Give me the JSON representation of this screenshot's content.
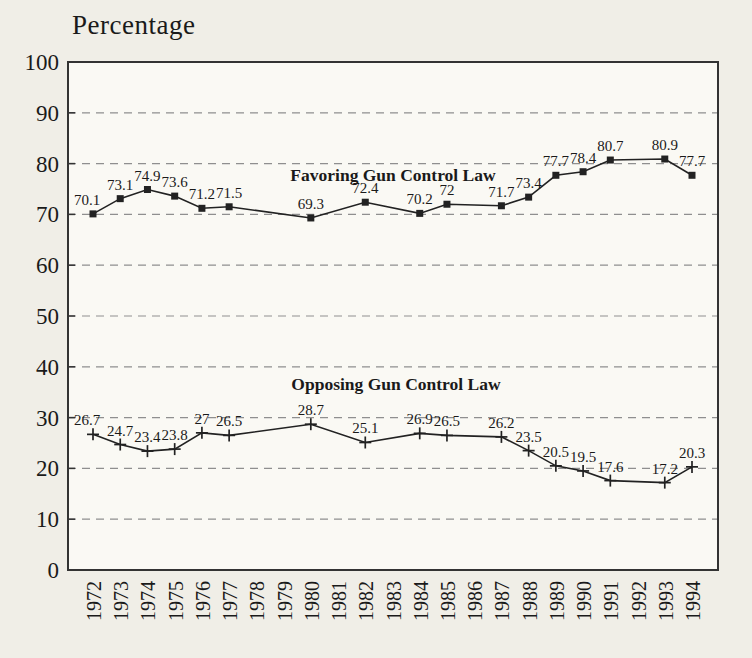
{
  "chart_data": {
    "type": "line",
    "title": "",
    "xlabel": "",
    "ylabel": "Percentage",
    "ylim": [
      0,
      100
    ],
    "ytick_step": 10,
    "grid": "horizontal dashed lines at 10 through 90",
    "legend_position": "inline text labels above each series",
    "categories": [
      "1972",
      "1973",
      "1974",
      "1975",
      "1976",
      "1977",
      "1978",
      "1979",
      "1980",
      "1981",
      "1982",
      "1983",
      "1984",
      "1985",
      "1986",
      "1987",
      "1988",
      "1989",
      "1990",
      "1991",
      "1992",
      "1993",
      "1994"
    ],
    "series": [
      {
        "name": "Favoring Gun Control Law",
        "marker": "square",
        "values": [
          70.1,
          73.1,
          74.9,
          73.6,
          71.2,
          71.5,
          null,
          null,
          69.3,
          null,
          72.4,
          null,
          70.2,
          72,
          null,
          71.7,
          73.4,
          77.7,
          78.4,
          80.7,
          null,
          80.9,
          77.7
        ]
      },
      {
        "name": "Opposing Gun Control Law",
        "marker": "plus",
        "values": [
          26.7,
          24.7,
          23.4,
          23.8,
          27,
          26.5,
          null,
          null,
          28.7,
          null,
          25.1,
          null,
          26.9,
          26.5,
          null,
          26.2,
          23.5,
          20.5,
          19.5,
          17.6,
          null,
          17.2,
          20.3
        ]
      }
    ],
    "colors": {
      "line": "#222222",
      "grid": "#8f8f8f",
      "text": "#1a1a1a",
      "border": "#333333",
      "plot_bg": "#faf9f4",
      "page_bg": "#f0eee7"
    }
  }
}
